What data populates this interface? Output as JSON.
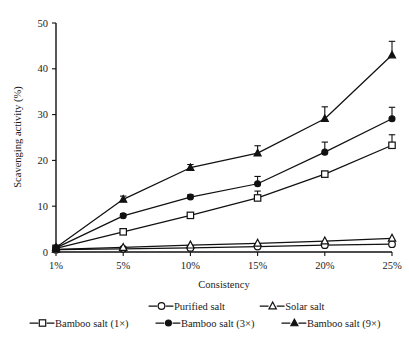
{
  "chart_data": {
    "type": "line",
    "title": "",
    "xlabel": "Consistency",
    "ylabel": "Scavenging activity (%)",
    "categories": [
      "1%",
      "5%",
      "10%",
      "15%",
      "20%",
      "25%"
    ],
    "x_positions": [
      1,
      5,
      10,
      15,
      20,
      25
    ],
    "ylim": [
      0,
      50
    ],
    "yticks": [
      0,
      10,
      20,
      30,
      40,
      50
    ],
    "ytick_labels": [
      "0",
      "10",
      "20",
      "30",
      "40",
      "50"
    ],
    "grid": false,
    "legend_position": "bottom",
    "series": [
      {
        "name": "Purified salt",
        "marker": "open-circle",
        "values": [
          0.5,
          0.7,
          0.9,
          1.2,
          1.5,
          1.7
        ],
        "errors": [
          0,
          0,
          0,
          0,
          0,
          0
        ]
      },
      {
        "name": "Solar salt",
        "marker": "open-triangle",
        "values": [
          0.6,
          1.0,
          1.5,
          1.9,
          2.4,
          3.0
        ],
        "errors": [
          0,
          0,
          0,
          0,
          0,
          0
        ]
      },
      {
        "name": "Bamboo salt (1×)",
        "marker": "open-square",
        "values": [
          0.8,
          4.4,
          8.0,
          11.8,
          17.0,
          23.3
        ],
        "errors": [
          0,
          0.7,
          0.5,
          1.5,
          0.6,
          2.3
        ]
      },
      {
        "name": "Bamboo salt (3×)",
        "marker": "solid-circle",
        "values": [
          0.9,
          7.9,
          12.0,
          14.9,
          21.8,
          29.1
        ],
        "errors": [
          0,
          0.5,
          0.5,
          1.6,
          2.2,
          2.5
        ]
      },
      {
        "name": "Bamboo salt (9×)",
        "marker": "solid-triangle",
        "values": [
          1.0,
          11.5,
          18.4,
          21.6,
          29.1,
          43.0
        ],
        "errors": [
          0,
          0.7,
          0.7,
          1.6,
          2.6,
          3.0
        ]
      }
    ]
  },
  "legend": {
    "row1": [
      {
        "label": "Purified salt",
        "marker": "open-circle"
      },
      {
        "label": "Solar salt",
        "marker": "open-triangle"
      }
    ],
    "row2": [
      {
        "label": "Bamboo salt (1×)",
        "marker": "open-square"
      },
      {
        "label": "Bamboo salt (3×)",
        "marker": "solid-circle"
      },
      {
        "label": "Bamboo salt (9×)",
        "marker": "solid-triangle"
      }
    ]
  },
  "colors": {
    "ink": "#111111",
    "background": "#ffffff"
  }
}
